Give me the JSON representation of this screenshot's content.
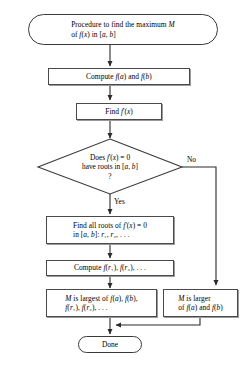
{
  "diagram": {
    "type": "flowchart",
    "orientation": "top-to-bottom",
    "stroke_color": "#3a3a3a",
    "background_color": "#ffffff",
    "nodes": [
      {
        "id": "start",
        "shape": "terminal",
        "text": "Procedure to find the maximum M\nof f(x) in [a, b]",
        "align": "left"
      },
      {
        "id": "compute_endpoints",
        "shape": "process",
        "text": "Compute f(a) and f(b)",
        "align": "center"
      },
      {
        "id": "find_derivative",
        "shape": "process",
        "text": "Find f'(x)",
        "align": "center"
      },
      {
        "id": "decision_roots",
        "shape": "decision",
        "text": "Does f'(x) = 0\nhave roots in [a, b]\n?",
        "align": "center"
      },
      {
        "id": "find_roots",
        "shape": "process",
        "text": "Find all roots of f'(x) = 0\nin [a, b]: r₁, r₂, . . .",
        "align": "left"
      },
      {
        "id": "compute_roots",
        "shape": "process",
        "text": "Compute f(r₁), f(r₂), . . .",
        "align": "left"
      },
      {
        "id": "m_largest",
        "shape": "process",
        "text": "M is largest of f(a), f(b),\nf(r₁), f(r₂), . . .",
        "align": "left"
      },
      {
        "id": "m_larger",
        "shape": "process",
        "text": "M is larger\nof f(a) and f(b)",
        "align": "left"
      },
      {
        "id": "done",
        "shape": "terminal",
        "text": "Done",
        "align": "center"
      }
    ],
    "edge_labels": {
      "yes": "Yes",
      "no": "No"
    },
    "edges": [
      {
        "from": "start",
        "to": "compute_endpoints",
        "label": ""
      },
      {
        "from": "compute_endpoints",
        "to": "find_derivative",
        "label": ""
      },
      {
        "from": "find_derivative",
        "to": "decision_roots",
        "label": ""
      },
      {
        "from": "decision_roots",
        "to": "find_roots",
        "label": "Yes"
      },
      {
        "from": "decision_roots",
        "to": "m_larger",
        "label": "No"
      },
      {
        "from": "find_roots",
        "to": "compute_roots",
        "label": ""
      },
      {
        "from": "compute_roots",
        "to": "m_largest",
        "label": ""
      },
      {
        "from": "m_largest",
        "to": "done",
        "label": ""
      },
      {
        "from": "m_larger",
        "to": "done",
        "label": ""
      }
    ]
  }
}
